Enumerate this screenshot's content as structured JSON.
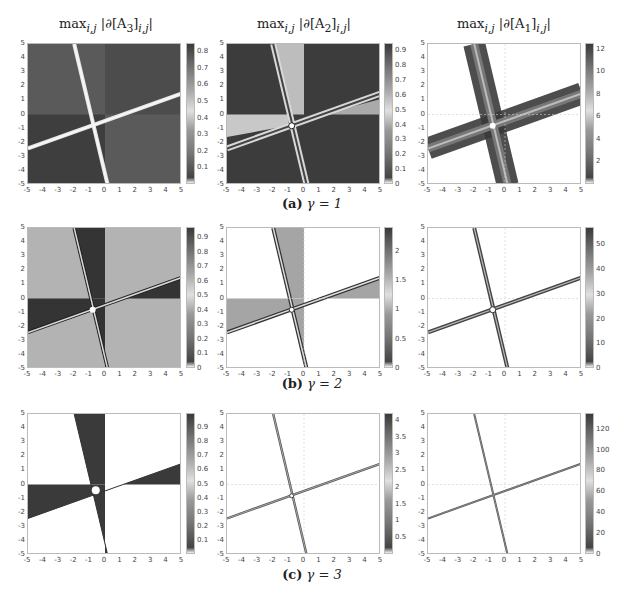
{
  "column_titles": [
    "max_{i,j} |∂[A3]_{i,j}|",
    "max_{i,j} |∂[A2]_{i,j}|",
    "max_{i,j} |∂[A1]_{i,j}|"
  ],
  "column_titles_display": [
    {
      "pre": "max",
      "sub": "i,j",
      "body": " |∂[A",
      "idx": "3",
      "post": "]",
      "sub2": "i,j",
      "end": "|"
    },
    {
      "pre": "max",
      "sub": "i,j",
      "body": " |∂[A",
      "idx": "2",
      "post": "]",
      "sub2": "i,j",
      "end": "|"
    },
    {
      "pre": "max",
      "sub": "i,j",
      "body": " |∂[A",
      "idx": "1",
      "post": "]",
      "sub2": "i,j",
      "end": "|"
    }
  ],
  "captions": {
    "a": {
      "label": "(a)",
      "text": "γ = 1"
    },
    "b": {
      "label": "(b)",
      "text": "γ = 2"
    },
    "c": {
      "label": "(c)",
      "text": "γ = 3"
    }
  },
  "axis_ticks": [
    "-5",
    "-4",
    "-3",
    "-2",
    "-1",
    "0",
    "1",
    "2",
    "3",
    "4",
    "5"
  ],
  "chart_data": [
    {
      "type": "heatmap",
      "row": "a",
      "gamma": 1,
      "title": "max_{i,j} |∂[A3]_{i,j}|",
      "xlim": [
        -5,
        5
      ],
      "ylim": [
        -5,
        5
      ],
      "colorbar": {
        "range": [
          0,
          0.85
        ],
        "ticks": [
          "0.1",
          "0.2",
          "0.3",
          "0.4",
          "0.5",
          "0.6",
          "0.7",
          "0.8"
        ]
      },
      "background": "dark",
      "features": "two bright crossing lines through ~(-0.7,-0.7), slopes ~ -4 and ~0.4; quadrant step at y=0 and x=0"
    },
    {
      "type": "heatmap",
      "row": "a",
      "gamma": 1,
      "title": "max_{i,j} |∂[A2]_{i,j}|",
      "xlim": [
        -5,
        5
      ],
      "ylim": [
        -5,
        5
      ],
      "colorbar": {
        "range": [
          0,
          0.95
        ],
        "ticks": [
          "0",
          "0.1",
          "0.2",
          "0.3",
          "0.4",
          "0.5",
          "0.6",
          "0.7",
          "0.8",
          "0.9"
        ]
      },
      "background": "dark",
      "features": "double bright lines crossing near (-0.8,-0.8), lighter wedges in upper-left strip and left-middle"
    },
    {
      "type": "heatmap",
      "row": "a",
      "gamma": 1,
      "title": "max_{i,j} |∂[A1]_{i,j}|",
      "xlim": [
        -5,
        5
      ],
      "ylim": [
        -5,
        5
      ],
      "colorbar": {
        "range": [
          0,
          12.5
        ],
        "ticks": [
          "2",
          "4",
          "6",
          "8",
          "10",
          "12"
        ]
      },
      "background": "white",
      "features": "wide dark bands along crossing lines"
    },
    {
      "type": "heatmap",
      "row": "b",
      "gamma": 2,
      "title": "max_{i,j} |∂[A3]_{i,j}|",
      "xlim": [
        -5,
        5
      ],
      "ylim": [
        -5,
        5
      ],
      "colorbar": {
        "range": [
          0,
          0.97
        ],
        "ticks": [
          "0",
          "0.1",
          "0.2",
          "0.3",
          "0.4",
          "0.5",
          "0.6",
          "0.7",
          "0.8",
          "0.9"
        ]
      },
      "background": "light gray",
      "features": "dark wedges between lines and axes, thin crossing lines"
    },
    {
      "type": "heatmap",
      "row": "b",
      "gamma": 2,
      "title": "max_{i,j} |∂[A2]_{i,j}|",
      "xlim": [
        -5,
        5
      ],
      "ylim": [
        -5,
        5
      ],
      "colorbar": {
        "range": [
          0,
          2.4
        ],
        "ticks": [
          "0",
          "0.5",
          "1",
          "1.5",
          "2"
        ]
      },
      "background": "white",
      "features": "gray wedges, thin double lines"
    },
    {
      "type": "heatmap",
      "row": "b",
      "gamma": 2,
      "title": "max_{i,j} |∂[A1]_{i,j}|",
      "xlim": [
        -5,
        5
      ],
      "ylim": [
        -5,
        5
      ],
      "colorbar": {
        "range": [
          0,
          57
        ],
        "ticks": [
          "0",
          "10",
          "20",
          "30",
          "40",
          "50"
        ]
      },
      "background": "white",
      "features": "narrow dark crossing lines"
    },
    {
      "type": "heatmap",
      "row": "c",
      "gamma": 3,
      "title": "max_{i,j} |∂[A3]_{i,j}|",
      "xlim": [
        -5,
        5
      ],
      "ylim": [
        -5,
        5
      ],
      "colorbar": {
        "range": [
          0,
          1
        ],
        "ticks": [
          "0.1",
          "0.2",
          "0.3",
          "0.4",
          "0.5",
          "0.6",
          "0.7",
          "0.8",
          "0.9"
        ]
      },
      "background": "white",
      "features": "solid dark wedges bounded by lines and axes"
    },
    {
      "type": "heatmap",
      "row": "c",
      "gamma": 3,
      "title": "max_{i,j} |∂[A2]_{i,j}|",
      "xlim": [
        -5,
        5
      ],
      "ylim": [
        -5,
        5
      ],
      "colorbar": {
        "range": [
          0,
          4.2
        ],
        "ticks": [
          "0.5",
          "1",
          "1.5",
          "2",
          "2.5",
          "3",
          "3.5",
          "4"
        ]
      },
      "background": "white",
      "features": "thin gray crossing lines"
    },
    {
      "type": "heatmap",
      "row": "c",
      "gamma": 3,
      "title": "max_{i,j} |∂[A1]_{i,j}|",
      "xlim": [
        -5,
        5
      ],
      "ylim": [
        -5,
        5
      ],
      "colorbar": {
        "range": [
          0,
          135
        ],
        "ticks": [
          "0",
          "20",
          "40",
          "60",
          "80",
          "100",
          "120"
        ]
      },
      "background": "white",
      "features": "very thin crossing lines"
    }
  ],
  "colorbar_ticks": {
    "a": [
      [
        "0.1",
        "0.2",
        "0.3",
        "0.4",
        "0.5",
        "0.6",
        "0.7",
        "0.8"
      ],
      [
        "0",
        "0.1",
        "0.2",
        "0.3",
        "0.4",
        "0.5",
        "0.6",
        "0.7",
        "0.8",
        "0.9"
      ],
      [
        "2",
        "4",
        "6",
        "8",
        "10",
        "12"
      ]
    ],
    "b": [
      [
        "0",
        "0.1",
        "0.2",
        "0.3",
        "0.4",
        "0.5",
        "0.6",
        "0.7",
        "0.8",
        "0.9"
      ],
      [
        "0",
        "0.5",
        "1",
        "1.5",
        "2"
      ],
      [
        "0",
        "10",
        "20",
        "30",
        "40",
        "50"
      ]
    ],
    "c": [
      [
        "0.1",
        "0.2",
        "0.3",
        "0.4",
        "0.5",
        "0.6",
        "0.7",
        "0.8",
        "0.9"
      ],
      [
        "0.5",
        "1",
        "1.5",
        "2",
        "2.5",
        "3",
        "3.5",
        "4"
      ],
      [
        "0",
        "20",
        "40",
        "60",
        "80",
        "100",
        "120"
      ]
    ]
  }
}
